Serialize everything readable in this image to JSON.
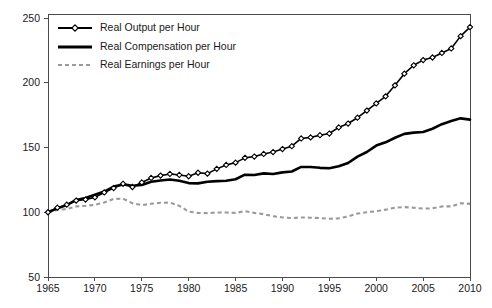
{
  "chart_data": {
    "type": "line",
    "title": "",
    "subtitle": "",
    "xlabel": "",
    "ylabel": "",
    "xlim": [
      1965,
      2010
    ],
    "ylim": [
      50,
      250
    ],
    "grid": false,
    "legend_position": "top-left",
    "y_ticks": [
      50,
      100,
      150,
      200,
      250
    ],
    "x_ticks": [
      1965,
      1970,
      1975,
      1980,
      1985,
      1990,
      1995,
      2000,
      2005,
      2010
    ],
    "y_tick_labels": [
      "50",
      "100",
      "150",
      "200",
      "250"
    ],
    "x_tick_labels": [
      "1965",
      "1970",
      "1975",
      "1980",
      "1985",
      "1990",
      "1995",
      "2000",
      "2005",
      "2010"
    ],
    "x": [
      1965,
      1966,
      1967,
      1968,
      1969,
      1970,
      1971,
      1972,
      1973,
      1974,
      1975,
      1976,
      1977,
      1978,
      1979,
      1980,
      1981,
      1982,
      1983,
      1984,
      1985,
      1986,
      1987,
      1988,
      1989,
      1990,
      1991,
      1992,
      1993,
      1994,
      1995,
      1996,
      1997,
      1998,
      1999,
      2000,
      2001,
      2002,
      2003,
      2004,
      2005,
      2006,
      2007,
      2008,
      2009,
      2010
    ],
    "series": [
      {
        "name": "Real Output per Hour",
        "color": "#000000",
        "style": "solid-markers",
        "marker": "diamond",
        "values": [
          100.0,
          103.5,
          105.8,
          109.0,
          109.8,
          111.5,
          115.3,
          118.7,
          122.0,
          119.5,
          123.0,
          126.5,
          128.3,
          129.6,
          128.8,
          127.8,
          130.5,
          129.8,
          133.5,
          136.5,
          138.3,
          142.0,
          143.0,
          145.0,
          146.5,
          148.8,
          151.0,
          157.0,
          157.8,
          159.5,
          160.8,
          165.5,
          168.5,
          173.0,
          178.5,
          184.0,
          189.5,
          198.0,
          207.0,
          213.5,
          217.5,
          219.5,
          223.0,
          226.5,
          236.0,
          243.0
        ]
      },
      {
        "name": "Real Compensation per Hour",
        "color": "#000000",
        "style": "solid",
        "marker": "none",
        "values": [
          100.0,
          103.0,
          105.5,
          109.5,
          111.0,
          113.5,
          116.0,
          119.8,
          121.5,
          120.5,
          121.0,
          123.5,
          124.5,
          125.3,
          124.3,
          122.5,
          122.3,
          123.5,
          124.0,
          124.3,
          125.5,
          129.0,
          128.8,
          130.0,
          129.5,
          130.8,
          131.5,
          135.0,
          135.0,
          134.3,
          134.0,
          135.5,
          138.0,
          143.0,
          146.5,
          151.5,
          154.0,
          157.5,
          160.5,
          161.5,
          162.0,
          164.5,
          168.0,
          170.5,
          172.5,
          171.5
        ]
      },
      {
        "name": "Real Earnings per Hour",
        "color": "#9a9a9a",
        "style": "dashed",
        "marker": "none",
        "values": [
          100.0,
          101.8,
          102.5,
          104.5,
          105.0,
          105.8,
          107.5,
          110.3,
          110.5,
          107.0,
          105.5,
          106.5,
          107.3,
          107.5,
          105.0,
          100.5,
          99.5,
          99.3,
          99.8,
          99.8,
          99.5,
          100.8,
          99.5,
          98.5,
          97.0,
          96.0,
          95.5,
          96.0,
          95.8,
          95.5,
          95.0,
          95.3,
          96.8,
          99.0,
          100.0,
          100.8,
          102.0,
          103.5,
          104.0,
          103.5,
          102.8,
          103.0,
          104.5,
          104.5,
          107.0,
          106.5
        ]
      }
    ]
  },
  "legend": {
    "items": [
      {
        "label": "Real Output per Hour"
      },
      {
        "label": "Real Compensation per Hour"
      },
      {
        "label": "Real Earnings per Hour"
      }
    ]
  }
}
